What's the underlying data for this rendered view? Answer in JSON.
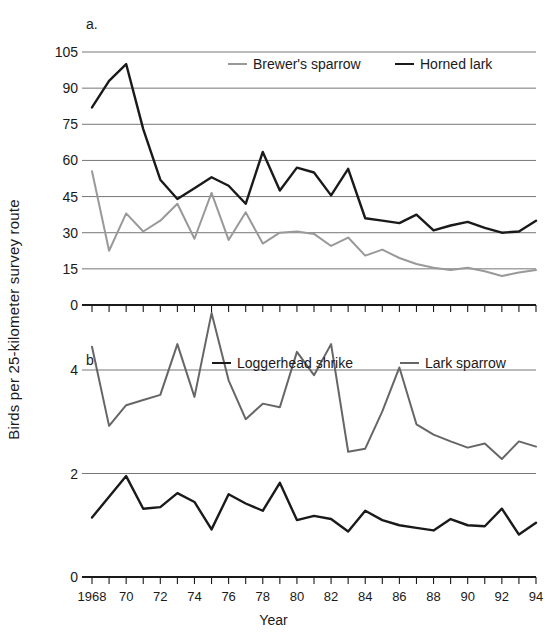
{
  "figure": {
    "axis_title_y": "Birds per 25-kilometer  survey route",
    "axis_title_x": "Year",
    "panel_a_label": "a.",
    "panel_b_label": "b."
  },
  "colors": {
    "dark_series": "#1a1a1a",
    "light_series": "#999999",
    "gridline": "#666666",
    "axis": "#1a1a1a",
    "background": "#ffffff"
  },
  "chart_data": [
    {
      "type": "line",
      "panel": "a.",
      "title": "",
      "xlabel": "Year",
      "ylabel": "Birds per 25-kilometer  survey route",
      "grid": true,
      "legend_position": "top-center",
      "xlim": [
        1968,
        1994
      ],
      "ylim": [
        0,
        105
      ],
      "yticks": [
        0,
        15,
        30,
        45,
        60,
        75,
        90,
        105
      ],
      "ytick_labels": [
        "0",
        "15",
        "30",
        "45",
        "60",
        "75",
        "90",
        "105"
      ],
      "x": [
        1968,
        1969,
        1970,
        1971,
        1972,
        1973,
        1974,
        1975,
        1976,
        1977,
        1978,
        1979,
        1980,
        1981,
        1982,
        1983,
        1984,
        1985,
        1986,
        1987,
        1988,
        1989,
        1990,
        1991,
        1992,
        1993,
        1994
      ],
      "xtick_labels": [
        "1968",
        "",
        "70",
        "",
        "72",
        "",
        "74",
        "",
        "76",
        "",
        "78",
        "",
        "80",
        "",
        "82",
        "",
        "84",
        "",
        "86",
        "",
        "88",
        "",
        "90",
        "",
        "92",
        "",
        "94"
      ],
      "series": [
        {
          "name": "Brewer's sparrow",
          "color": "#999999",
          "values": [
            55.5,
            22.5,
            38.0,
            30.5,
            35.0,
            42.0,
            27.5,
            46.5,
            27.0,
            38.5,
            25.5,
            30.0,
            30.5,
            29.5,
            24.5,
            28.0,
            20.5,
            23.0,
            19.5,
            17.0,
            15.5,
            14.5,
            15.5,
            14.0,
            12.0,
            13.5,
            14.5
          ]
        },
        {
          "name": "Horned lark",
          "color": "#1a1a1a",
          "values": [
            82.0,
            93.0,
            100.0,
            73.0,
            52.0,
            44.0,
            48.5,
            53.0,
            49.5,
            42.0,
            63.5,
            47.5,
            57.0,
            55.0,
            45.5,
            56.5,
            36.0,
            35.0,
            34.0,
            37.5,
            31.0,
            33.0,
            34.5,
            32.0,
            30.0,
            30.5,
            35.0
          ]
        }
      ]
    },
    {
      "type": "line",
      "panel": "b.",
      "title": "",
      "xlabel": "Year",
      "ylabel": "Birds per 25-kilometer  survey route",
      "grid": true,
      "legend_position": "top-center",
      "xlim": [
        1968,
        1994
      ],
      "ylim": [
        0,
        5.4
      ],
      "yticks": [
        0,
        2,
        4
      ],
      "ytick_labels": [
        "0",
        "2",
        "4"
      ],
      "x": [
        1968,
        1969,
        1970,
        1971,
        1972,
        1973,
        1974,
        1975,
        1976,
        1977,
        1978,
        1979,
        1980,
        1981,
        1982,
        1983,
        1984,
        1985,
        1986,
        1987,
        1988,
        1989,
        1990,
        1991,
        1992,
        1993,
        1994
      ],
      "xtick_labels": [
        "1968",
        "",
        "70",
        "",
        "72",
        "",
        "74",
        "",
        "76",
        "",
        "78",
        "",
        "80",
        "",
        "82",
        "",
        "84",
        "",
        "86",
        "",
        "88",
        "",
        "90",
        "",
        "92",
        "",
        "94"
      ],
      "series": [
        {
          "name": "Loggerhead shrike",
          "color": "#1a1a1a",
          "values": [
            1.15,
            1.55,
            1.95,
            1.32,
            1.35,
            1.62,
            1.45,
            0.92,
            1.6,
            1.42,
            1.28,
            1.82,
            1.1,
            1.18,
            1.12,
            0.88,
            1.28,
            1.1,
            1.0,
            0.95,
            0.9,
            1.12,
            1.0,
            0.98,
            1.32,
            0.82,
            1.05
          ]
        },
        {
          "name": "Lark sparrow",
          "color": "#666666",
          "values": [
            4.45,
            2.92,
            3.32,
            3.42,
            3.52,
            4.5,
            3.48,
            5.1,
            3.8,
            3.05,
            3.35,
            3.28,
            4.35,
            3.9,
            4.5,
            2.42,
            2.48,
            3.2,
            4.05,
            2.95,
            2.75,
            2.62,
            2.5,
            2.58,
            2.28,
            2.62,
            2.52
          ]
        }
      ]
    }
  ]
}
